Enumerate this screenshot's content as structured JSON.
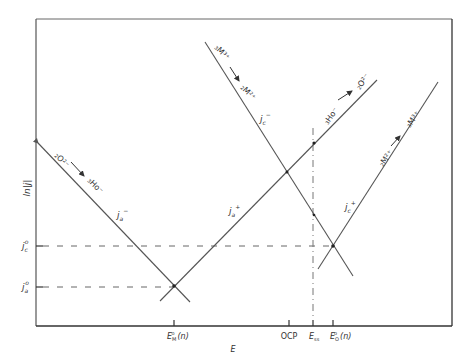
{
  "diagram": {
    "type": "evans-diagram",
    "colors": {
      "line": "#555555",
      "frame": "#444444",
      "text": "#333333",
      "background": "#ffffff"
    },
    "axes": {
      "y_label": "ln|j|",
      "x_label": "E",
      "y_ticks": [
        {
          "label_base": "j",
          "label_sub": "c",
          "label_sup": "o",
          "y": 246
        },
        {
          "label_base": "j",
          "label_sub": "a",
          "label_sup": "o",
          "y": 287
        }
      ],
      "x_ticks": [
        {
          "label_base": "E",
          "label_sub": "M",
          "label_sup": "o",
          "suffix": "(n)",
          "x": 174
        },
        {
          "label": "OCP",
          "x": 289
        },
        {
          "label_base": "E",
          "label_sub": "ss",
          "x": 313
        },
        {
          "label_base": "E",
          "label_sub": "O",
          "label_sup": "o",
          "suffix": "(n)",
          "x": 333
        }
      ]
    },
    "lines": [
      {
        "id": "oxide-cathodic",
        "current_label": "j",
        "current_sub": "a",
        "current_sup": "−",
        "reaction_from": "O²⁻",
        "reaction_from_sub": "2",
        "reaction_to": "Ho⁻",
        "reaction_to_sub": "3"
      },
      {
        "id": "oxide-anodic",
        "current_label": "j",
        "current_sub": "a",
        "current_sup": "+",
        "reaction_from": "Ho⁻",
        "reaction_from_sub": "3",
        "reaction_to": "O²⁻",
        "reaction_to_sub": "2"
      },
      {
        "id": "metal-cathodic",
        "current_label": "j",
        "current_sub": "c",
        "current_sup": "−",
        "reaction_from": "M³⁺",
        "reaction_from_sub": "3",
        "reaction_to": "M²⁺",
        "reaction_to_sub": "2"
      },
      {
        "id": "metal-anodic",
        "current_label": "j",
        "current_sub": "c",
        "current_sup": "+",
        "reaction_from": "M²⁺",
        "reaction_from_sub": "2",
        "reaction_to": "M³⁺",
        "reaction_to_sub": "3"
      }
    ]
  }
}
